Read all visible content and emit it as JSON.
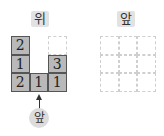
{
  "left_view": {
    "title": "위",
    "grid": [
      [
        "2",
        "",
        ""
      ],
      [
        "1",
        "",
        "3"
      ],
      [
        "2",
        "1",
        "1"
      ]
    ],
    "cell_state": [
      [
        "filled",
        "blank",
        "empty"
      ],
      [
        "filled",
        "blank",
        "filled"
      ],
      [
        "filled",
        "filled",
        "filled"
      ]
    ],
    "direction_label": "앞"
  },
  "right_view": {
    "title": "앞",
    "grid_rows": 3,
    "grid_cols": 3
  },
  "colors": {
    "filled_cell": "#b9b9b9",
    "label_bg": "#e2e2e2",
    "dashed_line": "#cfcfcf"
  }
}
